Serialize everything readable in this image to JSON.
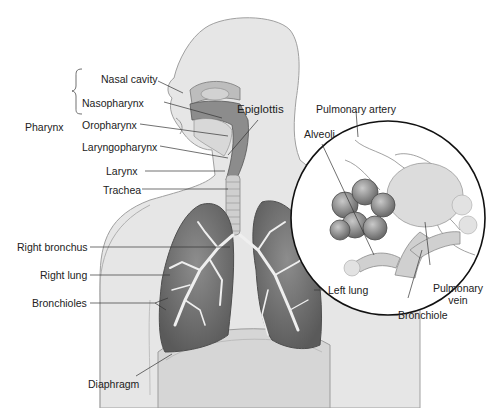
{
  "diagram": {
    "colors": {
      "body": "#e4e4e4",
      "body_outline": "#9a9a9a",
      "lung": "#7d7d7d",
      "lung_dark": "#5e5e5e",
      "bronchi": "#f0f0f0",
      "airway": "#8a8a8a",
      "leader": "#333333",
      "text": "#222222"
    },
    "labels": {
      "nasal_cavity": "Nasal cavity",
      "pharynx": "Pharynx",
      "nasopharynx": "Nasopharynx",
      "oropharynx": "Oropharynx",
      "laryngopharynx": "Laryngopharynx",
      "epiglottis": "Epiglottis",
      "larynx": "Larynx",
      "trachea": "Trachea",
      "right_bronchus": "Right bronchus",
      "right_lung": "Right lung",
      "bronchioles": "Bronchioles",
      "diaphragm": "Diaphragm",
      "left_lung": "Left lung",
      "pulmonary_artery": "Pulmonary artery",
      "alveoli": "Alveoli",
      "pulmonary_vein_line1": "Pulmonary",
      "pulmonary_vein_line2": "vein",
      "bronchiole": "Bronchiole"
    },
    "inset": {
      "description": "Magnified view of alveoli cluster",
      "center_x": 388,
      "center_y": 218,
      "radius": 97
    }
  }
}
